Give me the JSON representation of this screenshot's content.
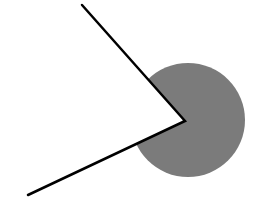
{
  "diagram": {
    "background": "#ffffff",
    "circle": {
      "cx": 188,
      "cy": 120,
      "r": 57,
      "fill": "#7b7b7b"
    },
    "wedge_cutout": {
      "fill": "#ffffff"
    },
    "vertex": {
      "x": 185,
      "y": 121
    },
    "ray_upper": {
      "x": 82,
      "y": 5
    },
    "ray_lower": {
      "x": 28,
      "y": 195
    },
    "stroke": {
      "color": "#000000",
      "width": 2.5
    }
  }
}
